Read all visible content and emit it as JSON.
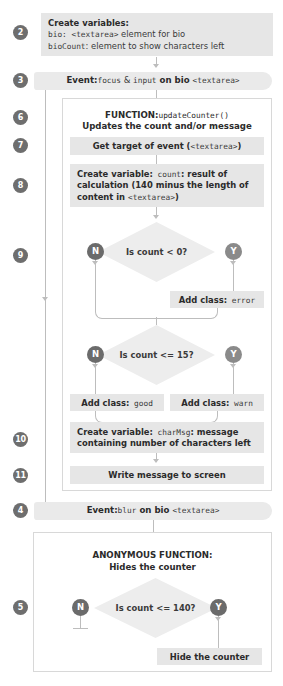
{
  "diagram": {
    "colors": {
      "box_fill": "#e6e6e6",
      "event_fill": "#eaeaea",
      "diamond_fill": "#ededed",
      "badge_fill": "#6e6e6e",
      "no_bubble": "#6b6b6b",
      "yes_bubble": "#8a8a8a",
      "connector": "#bdbdbd",
      "panel_border": "#d8d8d8",
      "text": "#3a3a3a",
      "background": "#ffffff"
    },
    "steps": [
      {
        "num": "2",
        "kind": "process"
      },
      {
        "num": "3",
        "kind": "event"
      },
      {
        "num": "6",
        "kind": "function-header"
      },
      {
        "num": "7",
        "kind": "process"
      },
      {
        "num": "8",
        "kind": "process"
      },
      {
        "num": "9",
        "kind": "decision"
      },
      {
        "num": "10",
        "kind": "process"
      },
      {
        "num": "11",
        "kind": "process"
      },
      {
        "num": "4",
        "kind": "event"
      },
      {
        "num": "5",
        "kind": "decision"
      }
    ],
    "step2": {
      "badge": "2",
      "line1": "Create variables:",
      "line2_a": "bio: ",
      "line2_b": "<textarea>",
      "line2_c": " element for bio",
      "line3_a": "bioCount",
      "line3_b": ": element to show characters left"
    },
    "step3": {
      "badge": "3",
      "label": "Event:",
      "text_a": "focus",
      "text_b": " & ",
      "text_c": "input",
      "text_d": " on bio ",
      "text_e": "<textarea>"
    },
    "step6": {
      "badge": "6",
      "label": "FUNCTION:",
      "name": "updateCounter()",
      "subtitle": "Updates the count and/or message"
    },
    "step7": {
      "badge": "7",
      "text_a": "Get target of event (",
      "text_b": "<textarea>",
      "text_c": ")"
    },
    "step8": {
      "badge": "8",
      "label": "Create variable:",
      "name": " count",
      "line1_rest": ": result of",
      "line2": "calculation (140 minus the length of",
      "line3_a": "content in ",
      "line3_b": "<textarea>",
      "line3_c": ")"
    },
    "step9": {
      "badge": "9",
      "decision1": "Is count < 0?",
      "no_label": "N",
      "yes_label": "Y",
      "yes_action_label": "Add class:",
      "yes_action_value": " error",
      "decision2": "Is count <= 15?",
      "no_action_label": "Add class:",
      "no_action_value": " good",
      "warn_action_label": "Add class:",
      "warn_action_value": " warn"
    },
    "step10": {
      "badge": "10",
      "label": "Create variable:",
      "name": " charMsg",
      "line1_rest": ": message",
      "line2": "containing number of characters left"
    },
    "step11": {
      "badge": "11",
      "text": "Write message to screen"
    },
    "step4": {
      "badge": "4",
      "label": "Event:",
      "text_a": "blur",
      "text_b": " on bio ",
      "text_c": "<textarea>"
    },
    "step5": {
      "badge": "5",
      "title": "ANONYMOUS FUNCTION:",
      "subtitle": "Hides the counter",
      "decision": "Is count <= 140?",
      "no_label": "N",
      "yes_label": "Y",
      "yes_action": "Hide the counter"
    }
  }
}
